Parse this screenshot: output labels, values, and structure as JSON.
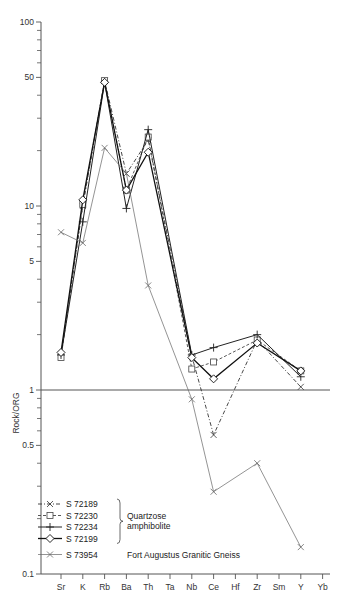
{
  "chart_data": {
    "type": "line",
    "title": "",
    "xlabel": "",
    "ylabel": "Rock/ORG",
    "yscale": "log",
    "ylim": [
      0.1,
      100
    ],
    "y_ticks_labeled": [
      {
        "value": 100,
        "label": "100"
      },
      {
        "value": 50,
        "label": "50"
      },
      {
        "value": 10,
        "label": "10"
      },
      {
        "value": 5,
        "label": "5"
      },
      {
        "value": 1,
        "label": "1"
      },
      {
        "value": 0.5,
        "label": "0.5"
      },
      {
        "value": 0.1,
        "label": "0.1"
      }
    ],
    "y_ticks_minor": [
      0.2,
      0.3,
      0.4,
      0.6,
      0.7,
      0.8,
      0.9,
      2,
      3,
      4,
      6,
      7,
      8,
      9,
      20,
      30,
      40,
      60,
      70,
      80,
      90
    ],
    "reference_line": 1,
    "categories": [
      "Sr",
      "K",
      "Rb",
      "Ba",
      "Th",
      "Ta",
      "Nb",
      "Ce",
      "Hf",
      "Zr",
      "Sm",
      "Y",
      "Yb"
    ],
    "series": [
      {
        "name": "S 72189",
        "group": "Quartzose amphibolite",
        "line": "dash-dot",
        "marker": "x",
        "values": [
          1.55,
          10.0,
          48,
          15,
          22.8,
          null,
          1.53,
          0.57,
          null,
          1.87,
          null,
          1.04,
          null
        ]
      },
      {
        "name": "S 72230",
        "group": "Quartzose amphibolite",
        "line": "dashed",
        "marker": "square",
        "values": [
          1.5,
          10.2,
          48,
          12.2,
          23.7,
          null,
          1.3,
          1.42,
          null,
          1.87,
          null,
          1.27,
          null
        ]
      },
      {
        "name": "S 72234",
        "group": "Quartzose amphibolite",
        "line": "solid",
        "marker": "plus",
        "values": [
          1.55,
          8.2,
          47,
          9.7,
          26,
          null,
          1.55,
          1.7,
          null,
          2.0,
          null,
          1.18,
          null
        ]
      },
      {
        "name": "S 72199",
        "group": "Quartzose amphibolite",
        "line": "solid-thick",
        "marker": "diamond",
        "values": [
          1.6,
          10.8,
          47,
          12.2,
          19.6,
          null,
          1.5,
          1.15,
          null,
          1.8,
          null,
          1.27,
          null
        ]
      },
      {
        "name": "S 73954",
        "group": "Fort Augustus Granitic Gneiss",
        "line": "thin-solid-grey",
        "marker": "x",
        "values": [
          7.2,
          6.3,
          20.7,
          15,
          3.7,
          null,
          0.89,
          0.28,
          null,
          0.4,
          null,
          0.14,
          null
        ]
      }
    ],
    "legend": {
      "position": "lower-left",
      "entries": [
        {
          "label": "S 72189"
        },
        {
          "label": "S 72230"
        },
        {
          "label": "S 72234"
        },
        {
          "label": "S 72199"
        },
        {
          "label": "S 73954"
        }
      ],
      "group_labels": [
        "Quartzose",
        "amphibolite",
        "Fort Augustus Granitic Gneiss"
      ]
    },
    "grid": false
  }
}
